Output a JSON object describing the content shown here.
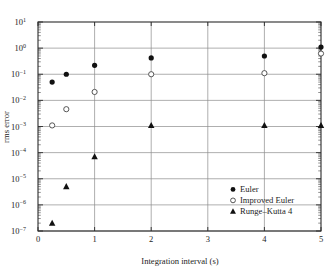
{
  "figure": {
    "background_color": "#ffffff",
    "frame_color": "#2b2b2b",
    "grid_color": "#8d8d8d"
  },
  "axes": {
    "x_label": "Integration interval (s)",
    "y_label": "rms error",
    "x_ticks": [
      "0",
      "1",
      "2",
      "3",
      "4",
      "5"
    ],
    "y_tick_mantissa": "10",
    "y_tick_exponents": [
      "1",
      "0",
      "−1",
      "−2",
      "−3",
      "−4",
      "−5",
      "−6",
      "−7"
    ]
  },
  "legend": {
    "entries": [
      {
        "label": "Euler",
        "marker": "filled-circle",
        "color": "#111111"
      },
      {
        "label": "Improved Euler",
        "marker": "open-circle",
        "color": "#444444"
      },
      {
        "label": "Runge–Kutta 4",
        "marker": "filled-triangle",
        "color": "#111111"
      }
    ]
  },
  "chart_data": {
    "type": "scatter",
    "title": "",
    "xlabel": "Integration interval (s)",
    "ylabel": "rms error",
    "xlim": [
      0,
      5
    ],
    "ylim": [
      1e-07,
      10
    ],
    "yscale": "log",
    "xscale": "linear",
    "grid": true,
    "legend_position": "lower right",
    "series": [
      {
        "name": "Euler",
        "marker": "filled-circle",
        "x": [
          0.25,
          0.5,
          1.0,
          2.0,
          4.0,
          5.0
        ],
        "y": [
          0.05,
          0.1,
          0.22,
          0.42,
          0.5,
          1.1
        ]
      },
      {
        "name": "Improved Euler",
        "marker": "open-circle",
        "x": [
          0.25,
          0.5,
          1.0,
          2.0,
          4.0,
          5.0
        ],
        "y": [
          0.0011,
          0.0046,
          0.021,
          0.1,
          0.11,
          0.62
        ]
      },
      {
        "name": "Runge–Kutta 4",
        "marker": "filled-triangle",
        "x": [
          0.25,
          0.5,
          1.0,
          2.0,
          4.0,
          5.0
        ],
        "y": [
          2e-07,
          5e-06,
          7e-05,
          0.0011,
          0.0011,
          0.0011
        ]
      }
    ]
  }
}
